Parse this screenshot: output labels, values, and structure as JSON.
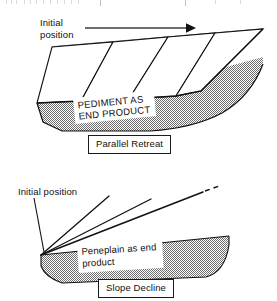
{
  "figure": {
    "background_color": "#ffffff",
    "ink_color": "#111111",
    "stipple_color": "#808080",
    "width": 277,
    "height": 301
  },
  "panels": [
    {
      "id": "parallel-retreat",
      "caption": "Parallel Retreat",
      "initial_position_label": "Initial\nposition",
      "inset_label": "PEDIMENT AS\nEND PRODUCT",
      "arrow": {
        "name": "retreat-direction-arrow",
        "direction": "right",
        "from_x": 85,
        "to_x": 192,
        "y": 28
      },
      "slope_faces": 4,
      "description": "Slope retreats parallel to itself leaving a pediment"
    },
    {
      "id": "slope-decline",
      "caption": "Slope Decline",
      "initial_position_label": "Initial position",
      "inset_label": "Peneplain as end\nproduct",
      "rays": 3,
      "dashed_extension": true,
      "description": "Slope angle declines about a fixed crest leaving a peneplain"
    }
  ]
}
